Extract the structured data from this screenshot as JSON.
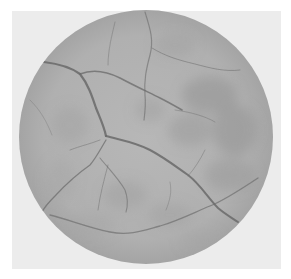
{
  "image": {
    "type": "fundus-photograph",
    "mode": "grayscale",
    "background_color": "#ffffff",
    "frame_color": "#ececec",
    "disc": {
      "cx": 146,
      "cy": 137,
      "r": 127,
      "base_color": "#b4b4b4",
      "edge_color": "#a6a6a6"
    },
    "vessel_color": "#6a6a6a"
  }
}
